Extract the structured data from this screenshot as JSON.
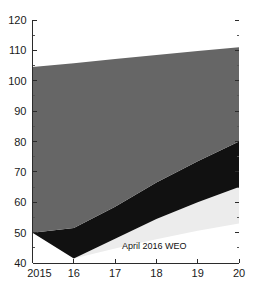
{
  "chart_data": {
    "type": "area",
    "title": "",
    "subtitle": "",
    "xlabel": "",
    "ylabel": "",
    "xlim": [
      2015,
      2020
    ],
    "ylim": [
      40,
      120
    ],
    "grid": false,
    "legend_position": "inline-annotation",
    "x": [
      2015,
      2016,
      2017,
      2018,
      2019,
      2020
    ],
    "xtick_labels": [
      "2015",
      "16",
      "17",
      "18",
      "19",
      "20"
    ],
    "ytick_labels": [
      "40",
      "50",
      "60",
      "70",
      "80",
      "90",
      "100",
      "110",
      "120"
    ],
    "ytick_values": [
      40,
      50,
      60,
      70,
      80,
      90,
      100,
      110,
      120
    ],
    "yminor_values": [
      45,
      55,
      65,
      75,
      85,
      95,
      105,
      115
    ],
    "series": [
      {
        "name": "2014 WEO",
        "role": "upper-boundary",
        "color": "#666666",
        "values": [
          104.5,
          105.8,
          107.2,
          108.5,
          109.8,
          111.0
        ]
      },
      {
        "name": "middle-band-upper",
        "role": "band-boundary",
        "color": "#111111",
        "values": [
          50.0,
          51.5,
          58.5,
          66.5,
          73.5,
          80.0
        ]
      },
      {
        "name": "middle-band-lower",
        "role": "band-boundary",
        "color": "#ececec",
        "values": [
          50.0,
          41.5,
          48.0,
          54.5,
          60.0,
          65.0
        ]
      },
      {
        "name": "April 2016 WEO",
        "role": "lower-boundary",
        "color": "#ececec",
        "values": [
          50.0,
          41.5,
          44.8,
          47.8,
          50.6,
          53.0
        ]
      }
    ],
    "annotations": [
      {
        "text": "2014 WEO",
        "x": 2015.55,
        "y": 108.5,
        "color": "#ffffff"
      },
      {
        "text": "April 2016 WEO",
        "x": 2017.95,
        "y": 44.7,
        "color": "#111111"
      }
    ]
  },
  "colors": {
    "band_top": "#666666",
    "band_middle": "#111111",
    "band_bottom": "#ececec",
    "axis": "#2b2b2b",
    "text": "#1a1a1a",
    "background": "#ffffff"
  }
}
